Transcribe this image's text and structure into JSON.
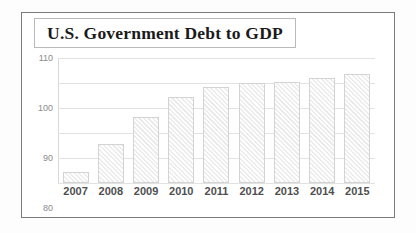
{
  "figure": {
    "title": "U.S. Government Debt to GDP"
  },
  "chart_data": {
    "type": "bar",
    "title": "U.S. Government Debt to GDP",
    "subtitle": "",
    "xlabel": "",
    "ylabel": "",
    "categories": [
      "2007",
      "2008",
      "2009",
      "2010",
      "2011",
      "2012",
      "2013",
      "2014",
      "2015"
    ],
    "values": [
      64.5,
      75.5,
      86.5,
      94.5,
      98.5,
      100.0,
      100.5,
      102.0,
      103.5
    ],
    "series": [
      {
        "name": "Debt to GDP",
        "values": [
          64.5,
          75.5,
          86.5,
          94.5,
          98.5,
          100.0,
          100.5,
          102.0,
          103.5
        ]
      }
    ],
    "ylim": [
      60,
      110
    ],
    "yticks": [
      60,
      70,
      80,
      90,
      100,
      110
    ],
    "ytick_labels": [
      "60",
      "70",
      "80",
      "90",
      "100",
      "110"
    ],
    "grid": true,
    "legend": false,
    "legend_position": "none",
    "bar_fill": "#ececec",
    "bar_edge": "#d3d3d3",
    "bar_hatch": "diagonal"
  }
}
